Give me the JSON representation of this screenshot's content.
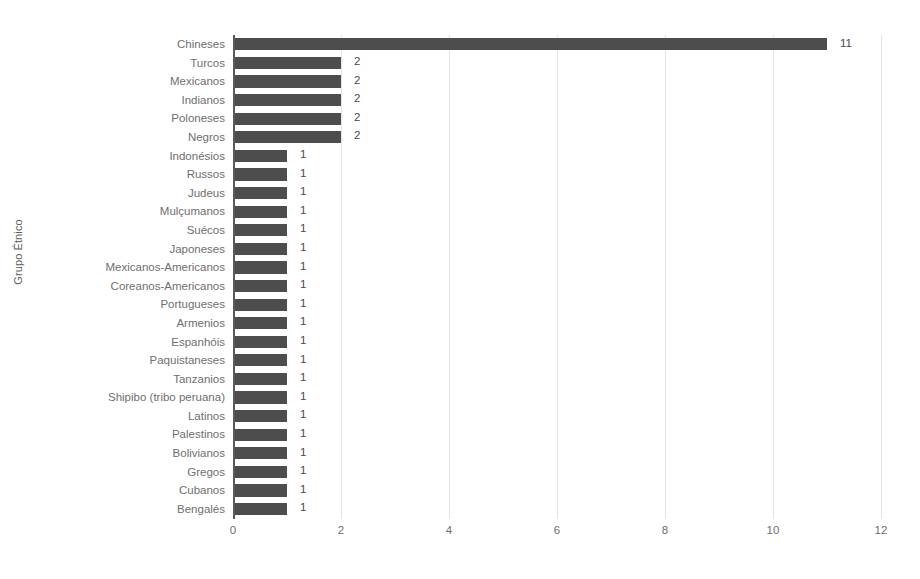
{
  "chart_data": {
    "type": "bar",
    "orientation": "horizontal",
    "title": "",
    "xlabel": "",
    "ylabel": "Grupo Étnico",
    "xlim": [
      0,
      12
    ],
    "xticks": [
      "0",
      "2",
      "4",
      "6",
      "8",
      "10",
      "12"
    ],
    "xtick_values": [
      0,
      2,
      4,
      6,
      8,
      10,
      12
    ],
    "grid": true,
    "legend": null,
    "bar_color": "#4d4d4d",
    "label_color": "#6f6f6f",
    "gridline_color": "#e4e4e4",
    "axis_color": "#5a5a5a",
    "show_value_labels": true,
    "categories": [
      "Chineses",
      "Turcos",
      "Mexicanos",
      "Indianos",
      "Poloneses",
      "Negros",
      "Indonésios",
      "Russos",
      "Judeus",
      "Mulçumanos",
      "Suécos",
      "Japoneses",
      "Mexicanos-Americanos",
      "Coreanos-Americanos",
      "Portugueses",
      "Armenios",
      "Espanhóis",
      "Paquistaneses",
      "Tanzanios",
      "Shipibo (tribo peruana)",
      "Latinos",
      "Palestinos",
      "Bolivianos",
      "Gregos",
      "Cubanos",
      "Bengalés"
    ],
    "values": [
      11,
      2,
      2,
      2,
      2,
      2,
      1,
      1,
      1,
      1,
      1,
      1,
      1,
      1,
      1,
      1,
      1,
      1,
      1,
      1,
      1,
      1,
      1,
      1,
      1,
      1
    ],
    "value_labels": [
      "11",
      "2",
      "2",
      "2",
      "2",
      "2",
      "1",
      "1",
      "1",
      "1",
      "1",
      "1",
      "1",
      "1",
      "1",
      "1",
      "1",
      "1",
      "1",
      "1",
      "1",
      "1",
      "1",
      "1",
      "1",
      "1"
    ]
  }
}
